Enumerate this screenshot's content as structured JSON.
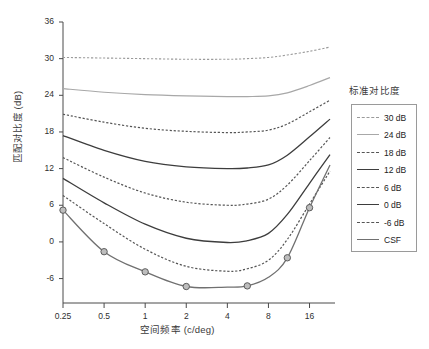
{
  "chart_data": {
    "type": "line",
    "title": "",
    "xlabel": "空间频率 (c/deg)",
    "ylabel": "匹配对比度 (dB)",
    "xscale": "log2",
    "xlim": [
      0.25,
      22.6
    ],
    "ylim": [
      -10,
      36
    ],
    "grid": false,
    "legend_position": "right",
    "legend_title": "标准对比度",
    "xticks": [
      0.25,
      0.5,
      1,
      2,
      4,
      8,
      16
    ],
    "xtick_labels": [
      "0.25",
      "0.5",
      "1",
      "2",
      "4",
      "8",
      "16"
    ],
    "yticks": [
      36,
      30,
      24,
      18,
      12,
      6,
      0,
      -6
    ],
    "ytick_labels": [
      "36",
      "30",
      "24",
      "18",
      "12",
      "6",
      "0",
      "-6"
    ],
    "x": [
      0.25,
      0.5,
      1,
      2,
      4,
      5.6,
      8,
      11,
      16,
      22.6
    ],
    "series": [
      {
        "name": "30 dB",
        "label": "30 dB",
        "style": "dashed",
        "color": "#9a9a9a",
        "width": 1.1,
        "markers": false,
        "values": [
          30.2,
          30.1,
          30.0,
          29.9,
          29.9,
          30.0,
          30.2,
          30.6,
          31.2,
          31.9
        ]
      },
      {
        "name": "24 dB",
        "label": "24 dB",
        "style": "solid",
        "color": "#a8a8a8",
        "width": 1.2,
        "markers": false,
        "values": [
          25.1,
          24.5,
          24.1,
          23.9,
          23.8,
          23.8,
          23.9,
          24.4,
          25.6,
          26.9
        ]
      },
      {
        "name": "18 dB",
        "label": "18 dB",
        "style": "dashed",
        "color": "#555555",
        "width": 1.2,
        "markers": false,
        "values": [
          20.9,
          19.6,
          18.6,
          18.1,
          17.9,
          18.0,
          18.3,
          19.3,
          21.3,
          23.2
        ]
      },
      {
        "name": "12 dB",
        "label": "12 dB",
        "style": "solid",
        "color": "#3d3d3d",
        "width": 1.3,
        "markers": false,
        "values": [
          17.4,
          15.0,
          13.2,
          12.3,
          12.0,
          12.1,
          12.6,
          14.2,
          17.2,
          20.1
        ]
      },
      {
        "name": "6 dB",
        "label": "6 dB",
        "style": "dashed",
        "color": "#555555",
        "width": 1.2,
        "markers": false,
        "values": [
          13.8,
          10.6,
          8.0,
          6.5,
          6.0,
          6.2,
          7.0,
          9.3,
          13.3,
          17.1
        ]
      },
      {
        "name": "0 dB",
        "label": "0 dB",
        "style": "solid",
        "color": "#3d3d3d",
        "width": 1.3,
        "markers": false,
        "values": [
          10.4,
          6.4,
          2.9,
          0.6,
          -0.1,
          0.2,
          1.4,
          4.5,
          9.6,
          14.3
        ]
      },
      {
        "name": "-6 dB",
        "label": "-6 dB",
        "style": "dashed",
        "color": "#555555",
        "width": 1.2,
        "markers": false,
        "values": [
          7.6,
          3.0,
          -1.2,
          -4.0,
          -4.8,
          -4.4,
          -3.0,
          0.4,
          6.2,
          11.6
        ]
      },
      {
        "name": "CSF",
        "label": "CSF",
        "style": "solid",
        "color": "#707070",
        "width": 1.3,
        "markers": true,
        "marker_x": [
          0.25,
          0.5,
          1,
          2,
          5.6,
          11,
          16
        ],
        "marker_y": [
          5.2,
          -1.6,
          -4.9,
          -7.3,
          -7.2,
          -2.6,
          5.6
        ],
        "values": [
          5.2,
          -1.6,
          -4.9,
          -7.3,
          -7.4,
          -7.2,
          -5.8,
          -2.6,
          5.6,
          12.6
        ]
      }
    ]
  }
}
